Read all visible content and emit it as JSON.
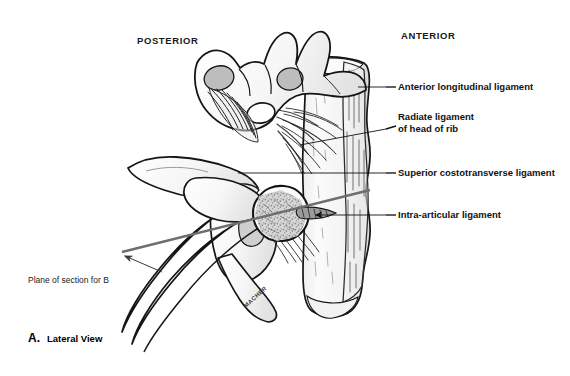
{
  "figure": {
    "orientation_labels": {
      "posterior": "POSTERIOR",
      "anterior": "ANTERIOR"
    },
    "callouts": [
      {
        "id": "anterior-longitudinal-ligament",
        "lines": [
          "Anterior longitudinal ligament"
        ],
        "text_x": 398,
        "text_y": 90,
        "leader": {
          "x1": 386,
          "y1": 87,
          "x2": 395,
          "y2": 87
        },
        "pointer": {
          "x1": 386,
          "y1": 87,
          "x2": 330,
          "y2": 87
        }
      },
      {
        "id": "radiate-ligament-of-head-of-rib",
        "lines": [
          "Radiate ligament",
          "of head of rib"
        ],
        "text_x": 398,
        "text_y": 120,
        "leader": {
          "x1": 386,
          "y1": 129,
          "x2": 395,
          "y2": 126
        },
        "pointer": {
          "x1": 386,
          "y1": 129,
          "x2": 302,
          "y2": 143
        }
      },
      {
        "id": "superior-costotransverse-ligament",
        "lines": [
          "Superior costotransverse ligament"
        ],
        "text_x": 398,
        "text_y": 176,
        "leader": {
          "x1": 386,
          "y1": 173,
          "x2": 395,
          "y2": 173
        },
        "pointer": {
          "x1": 386,
          "y1": 173,
          "x2": 240,
          "y2": 173
        }
      },
      {
        "id": "intra-articular-ligament",
        "lines": [
          "Intra-articular ligament"
        ],
        "text_x": 398,
        "text_y": 218,
        "leader": {
          "x1": 386,
          "y1": 215,
          "x2": 395,
          "y2": 215
        },
        "pointer": {
          "x1": 386,
          "y1": 215,
          "x2": 306,
          "y2": 215
        }
      }
    ],
    "plane_of_section": {
      "label": "Plane of section for B",
      "text_x": 28,
      "text_y": 283
    },
    "caption": {
      "letter": "A.",
      "text": "Lateral View"
    },
    "artist_signature": "MACHER",
    "colors": {
      "ink": "#151515",
      "bone_fill": "#f4f4f4",
      "bone_shadow": "#d9d9d9",
      "facet_gray": "#b8b8b8",
      "plane_line": "#6e6e6e",
      "background": "#ffffff"
    }
  }
}
